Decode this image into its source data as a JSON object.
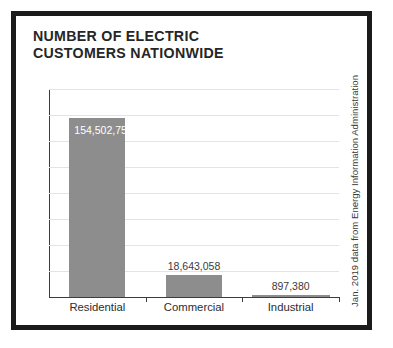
{
  "card": {
    "title": "NUMBER OF ELECTRIC\nCUSTOMERS NATIONWIDE",
    "source_note": "Jan. 2019 data from Energy Information Administration"
  },
  "colors": {
    "frame": "#1b1b1b",
    "bar": "#8d8d8d",
    "gridline": "#e4e4e4",
    "axis": "#3c3c3c",
    "title_text": "#262626",
    "label_text_inside": "#ffffff",
    "label_text_outside": "#3a3a3a"
  },
  "chart_data": {
    "type": "bar",
    "title": "NUMBER OF ELECTRIC CUSTOMERS NATIONWIDE",
    "xlabel": "",
    "ylabel": "",
    "categories": [
      "Residential",
      "Commercial",
      "Industrial"
    ],
    "values": [
      154502755,
      18643058,
      897380
    ],
    "value_labels": [
      "154,502,755",
      "18,643,058",
      "897,380"
    ],
    "ylim": [
      0,
      180000000
    ],
    "grid": true,
    "gridline_count": 8,
    "legend": "none",
    "annotations": [
      "Jan. 2019 data from Energy Information Administration"
    ]
  }
}
